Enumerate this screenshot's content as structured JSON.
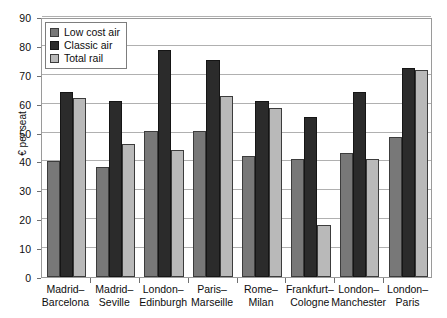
{
  "chart_data": {
    "type": "bar",
    "title": "",
    "xlabel": "",
    "ylabel": "€ per seat",
    "ylim": [
      0,
      90
    ],
    "ytick_step": 10,
    "yticks": [
      0,
      10,
      20,
      30,
      40,
      50,
      60,
      70,
      80,
      90
    ],
    "grid": true,
    "legend_position": "top-left",
    "categories": [
      "Madrid–Barcelona",
      "Madrid–Seville",
      "London–Edinburgh",
      "Paris–Marseille",
      "Rome–Milan",
      "Frankfurt–Cologne",
      "London–Manchester",
      "London–Paris"
    ],
    "category_lines": [
      [
        "Madrid–",
        "Barcelona"
      ],
      [
        "Madrid–",
        "Seville"
      ],
      [
        "London–",
        "Edinburgh"
      ],
      [
        "Paris–",
        "Marseille"
      ],
      [
        "Rome–",
        "Milan"
      ],
      [
        "Frankfurt–",
        "Cologne"
      ],
      [
        "London–",
        "Manchester"
      ],
      [
        "London–",
        "Paris"
      ]
    ],
    "series": [
      {
        "name": "Low cost air",
        "color": "#787878",
        "values": [
          40,
          38,
          50.5,
          50.5,
          42,
          41,
          43,
          48.5
        ]
      },
      {
        "name": "Classic air",
        "color": "#2b2b2b",
        "values": [
          64,
          61,
          78.5,
          75,
          61,
          55.5,
          64,
          72.5
        ]
      },
      {
        "name": "Total rail",
        "color": "#b9b9b9",
        "values": [
          62,
          46,
          44,
          62.5,
          58.5,
          18,
          41,
          71.5
        ]
      }
    ]
  }
}
